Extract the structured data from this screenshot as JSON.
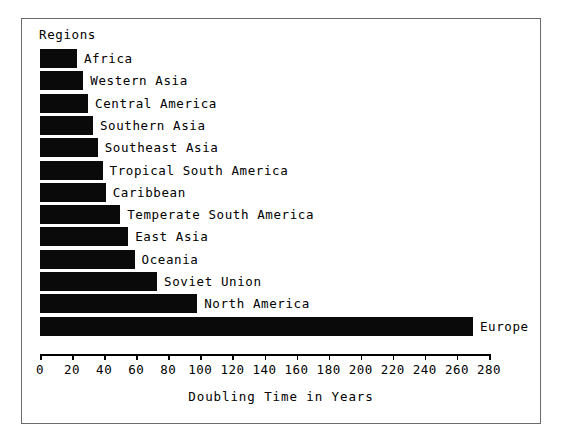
{
  "figure": {
    "legend_title": "Regions",
    "xaxis_title": "Doubling Time in Years"
  },
  "chart_data": {
    "type": "bar",
    "orientation": "horizontal",
    "title": "",
    "xlabel": "Doubling Time in Years",
    "ylabel": "Regions",
    "xlim": [
      0,
      280
    ],
    "grid": false,
    "legend_position": "none",
    "bar_color": "#0a0a0a",
    "xticks": [
      0,
      20,
      40,
      60,
      80,
      100,
      120,
      140,
      160,
      180,
      200,
      220,
      240,
      260,
      280
    ],
    "xtick_labels": [
      "0",
      "20",
      "40",
      "60",
      "80",
      "100",
      "120",
      "140",
      "160",
      "180",
      "200",
      "220",
      "240",
      "260",
      "280"
    ],
    "categories": [
      "Africa",
      "Western Asia",
      "Central America",
      "Southern Asia",
      "Southeast Asia",
      "Tropical South America",
      "Caribbean",
      "Temperate South America",
      "East Asia",
      "Oceania",
      "Soviet Union",
      "North America",
      "Europe"
    ],
    "values": [
      23,
      27,
      30,
      33,
      36,
      39,
      41,
      50,
      55,
      59,
      73,
      98,
      270
    ]
  }
}
